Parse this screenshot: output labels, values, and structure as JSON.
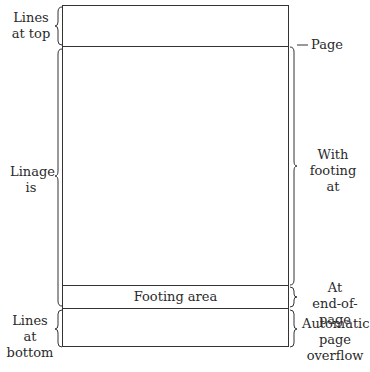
{
  "diagram": {
    "left_labels": {
      "lines_at_top": [
        "Lines",
        "at top"
      ],
      "linage_is": [
        "Linage",
        "is"
      ],
      "lines_at_bottom": [
        "Lines at",
        "bottom"
      ]
    },
    "right_labels": {
      "page": "Page",
      "with_footing_at": [
        "With",
        "footing",
        "at"
      ],
      "at_end_of_page": [
        "At",
        "end-of-page"
      ],
      "automatic_page_overflow": [
        "Automatic",
        "page",
        "overflow"
      ]
    },
    "regions": {
      "footing_area": "Footing area"
    },
    "colors": {
      "line": "#333333",
      "text": "#2a2a2a",
      "background": "#ffffff"
    }
  }
}
